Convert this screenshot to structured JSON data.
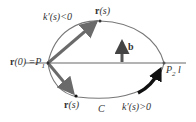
{
  "diagram": {
    "labels": {
      "r0_prefix": "r",
      "r0_rest": "(0) =P",
      "r0_sub": "1",
      "k_neg": "k′(s)<0",
      "r_top": "r",
      "r_top_arg": "(s)",
      "b": "b",
      "p2": "P",
      "p2_sub": "2",
      "line_l": "l",
      "r_bottom": "r",
      "r_bottom_arg": "(s)",
      "curve_c": "C",
      "k_pos": "k′(s)>0"
    },
    "colors": {
      "line": "#9a9a9a",
      "curve": "#6f6f6f",
      "vector": "#6a6a6a",
      "b_arrow": "#555555",
      "thick_arrow": "#111111"
    }
  }
}
